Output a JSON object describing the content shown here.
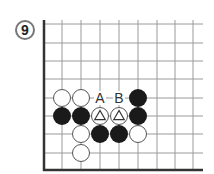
{
  "problem": {
    "number": "9",
    "badge_center": [
      25,
      30
    ],
    "badge_radius": 9
  },
  "board": {
    "columns_x": [
      44,
      62,
      81,
      100,
      119,
      138,
      157,
      175,
      193
    ],
    "rows_y": [
      24,
      43,
      61,
      79,
      98,
      116,
      134,
      153
    ],
    "left_edge_x": 44,
    "bottom_edge_y": 170,
    "line_top_y": 20,
    "line_right_x": 203,
    "line_color": "#9a9a9a",
    "edge_color": "#333333",
    "stone_radius": 9
  },
  "stones": [
    {
      "color": "white",
      "col": 1,
      "row": 4
    },
    {
      "color": "white",
      "col": 2,
      "row": 4
    },
    {
      "color": "black",
      "col": 5,
      "row": 4
    },
    {
      "color": "black",
      "col": 1,
      "row": 5
    },
    {
      "color": "black",
      "col": 2,
      "row": 5
    },
    {
      "color": "white",
      "col": 3,
      "row": 5,
      "mark": "triangle"
    },
    {
      "color": "white",
      "col": 4,
      "row": 5,
      "mark": "triangle"
    },
    {
      "color": "black",
      "col": 5,
      "row": 5
    },
    {
      "color": "white",
      "col": 2,
      "row": 6
    },
    {
      "color": "black",
      "col": 3,
      "row": 6
    },
    {
      "color": "black",
      "col": 4,
      "row": 6
    },
    {
      "color": "white",
      "col": 5,
      "row": 6
    },
    {
      "color": "white",
      "col": 2,
      "row": 7
    }
  ],
  "labels": [
    {
      "text": "A",
      "col": 3,
      "row": 4
    },
    {
      "text": "B",
      "col": 4,
      "row": 4
    }
  ],
  "colors": {
    "black_stone": "#1a1a1a",
    "white_stone": "#ffffff",
    "stone_outline": "#555555",
    "label": "#333333",
    "badge_ring": "#777777",
    "badge_text": "#222222"
  }
}
